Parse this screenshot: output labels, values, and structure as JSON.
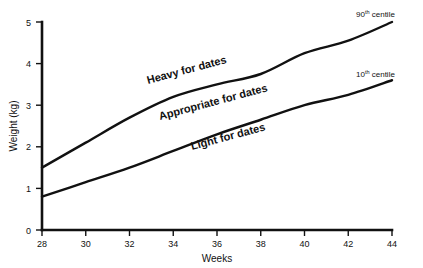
{
  "chart_data": {
    "type": "line",
    "title": "",
    "xlabel": "Weeks",
    "ylabel": "Weight (kg)",
    "xlim": [
      28,
      44
    ],
    "ylim": [
      0,
      5
    ],
    "xticks": [
      "28",
      "30",
      "32",
      "34",
      "36",
      "38",
      "40",
      "42",
      "44"
    ],
    "yticks": [
      "0",
      "1",
      "2",
      "3",
      "4",
      "5"
    ],
    "grid": false,
    "legend_position": "inline-right",
    "x": [
      28,
      30,
      32,
      34,
      36,
      38,
      40,
      42,
      44
    ],
    "series": [
      {
        "name": "90th centile",
        "label_html": "90<sup>th</sup> centile",
        "label_main": "90",
        "label_sup": "th",
        "label_tail": " centile",
        "values": [
          1.5,
          2.1,
          2.7,
          3.2,
          3.5,
          3.75,
          4.25,
          4.55,
          5.0
        ]
      },
      {
        "name": "10th centile",
        "label_html": "10<sup>th</sup> centile",
        "label_main": "10",
        "label_sup": "th",
        "label_tail": " centile",
        "values": [
          0.8,
          1.15,
          1.5,
          1.9,
          2.3,
          2.65,
          3.0,
          3.25,
          3.6
        ]
      }
    ],
    "annotations": [
      {
        "text": "Heavy for dates",
        "region": "above-90th-centile"
      },
      {
        "text": "Appropriate for dates",
        "region": "between-centiles"
      },
      {
        "text": "Light for dates",
        "region": "below-10th-centile"
      }
    ]
  },
  "axes": {
    "y_title": "Weight (kg)",
    "x_title": "Weeks",
    "y_tick_0": "0",
    "y_tick_1": "1",
    "y_tick_2": "2",
    "y_tick_3": "3",
    "y_tick_4": "4",
    "y_tick_5": "5",
    "x_tick_28": "28",
    "x_tick_30": "30",
    "x_tick_32": "32",
    "x_tick_34": "34",
    "x_tick_36": "36",
    "x_tick_38": "38",
    "x_tick_40": "40",
    "x_tick_42": "42",
    "x_tick_44": "44"
  },
  "labels": {
    "heavy": "Heavy for dates",
    "appropriate": "Appropriate for dates",
    "light": "Light for dates",
    "centile90_main": "90",
    "centile90_sup": "th",
    "centile90_tail": "centile",
    "centile10_main": "10",
    "centile10_sup": "th",
    "centile10_tail": "centile"
  },
  "colors": {
    "ink": "#111111",
    "background": "#ffffff"
  }
}
